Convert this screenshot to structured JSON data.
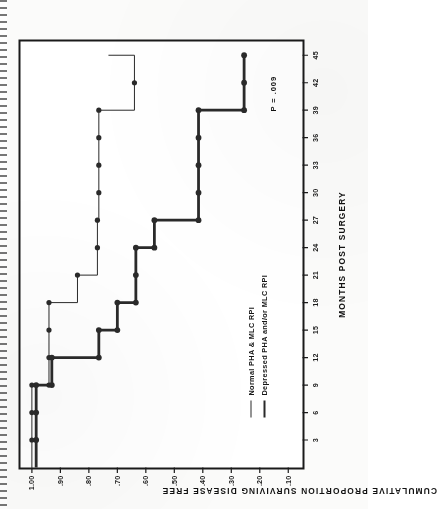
{
  "figure": {
    "p_value_annotation": "P = .009",
    "xlabel": "MONTHS POST SURGERY",
    "ylabel": "CUMULATIVE PROPORTION SURVIVING DISEASE FREE"
  },
  "legend": {
    "items": [
      {
        "label": "Normal PHA & MLC RPI",
        "style": "thin"
      },
      {
        "label": "Depressed PHA and/or MLC RPI",
        "style": "thick"
      }
    ]
  },
  "axis": {
    "x_ticks": [
      "3",
      "6",
      "9",
      "12",
      "15",
      "18",
      "21",
      "24",
      "27",
      "30",
      "33",
      "36",
      "39",
      "42",
      "45"
    ],
    "y_ticks": [
      "1.00",
      ".90",
      ".80",
      ".70",
      ".60",
      ".50",
      ".40",
      ".30",
      ".20",
      ".10"
    ]
  },
  "chart_data": {
    "type": "line",
    "subtype": "kaplan-meier-step",
    "title": "",
    "xlabel": "MONTHS POST SURGERY",
    "ylabel": "CUMULATIVE PROPORTION SURVIVING DISEASE FREE",
    "xlim": [
      0,
      46.5
    ],
    "ylim": [
      0.05,
      1.04
    ],
    "xticks": [
      3,
      6,
      9,
      12,
      15,
      18,
      21,
      24,
      27,
      30,
      33,
      36,
      39,
      42,
      45
    ],
    "yticks": [
      1.0,
      0.9,
      0.8,
      0.7,
      0.6,
      0.5,
      0.4,
      0.3,
      0.2,
      0.1
    ],
    "ytick_labels": [
      "1.00",
      ".90",
      ".80",
      ".70",
      ".60",
      ".50",
      ".40",
      ".30",
      ".20",
      ".10"
    ],
    "grid": false,
    "legend_position": "lower-left-inside",
    "annotations": [
      {
        "text": "P = .009",
        "x": 43.5,
        "y": 0.12
      }
    ],
    "series": [
      {
        "name": "Normal PHA & MLC RPI",
        "style": "thin",
        "color": "#2a2a2a",
        "linewidth": 1.0,
        "marker": "filled-circle",
        "points": [
          {
            "x": 0,
            "y": 1.0,
            "marker": false
          },
          {
            "x": 3,
            "y": 1.0,
            "marker": true
          },
          {
            "x": 6,
            "y": 1.0,
            "marker": true
          },
          {
            "x": 9,
            "y": 1.0,
            "marker": true
          },
          {
            "x": 9,
            "y": 0.94,
            "marker": true
          },
          {
            "x": 12,
            "y": 0.94,
            "marker": true
          },
          {
            "x": 12,
            "y": 0.88,
            "marker": false
          },
          {
            "x": 15,
            "y": 0.94,
            "marker": true
          },
          {
            "x": 18,
            "y": 0.94,
            "marker": true
          },
          {
            "x": 18,
            "y": 0.84,
            "marker": false
          },
          {
            "x": 21,
            "y": 0.84,
            "marker": true
          },
          {
            "x": 21,
            "y": 0.77,
            "marker": false
          },
          {
            "x": 24,
            "y": 0.77,
            "marker": true
          },
          {
            "x": 27,
            "y": 0.77,
            "marker": true
          },
          {
            "x": 27,
            "y": 0.765,
            "marker": false
          },
          {
            "x": 30,
            "y": 0.765,
            "marker": true
          },
          {
            "x": 33,
            "y": 0.765,
            "marker": true
          },
          {
            "x": 36,
            "y": 0.765,
            "marker": true
          },
          {
            "x": 39,
            "y": 0.765,
            "marker": true
          },
          {
            "x": 42,
            "y": 0.64,
            "marker": true
          },
          {
            "x": 45,
            "y": 0.64,
            "marker": false
          }
        ],
        "step_path": [
          [
            0,
            1.0
          ],
          [
            9,
            1.0
          ],
          [
            9,
            0.94
          ],
          [
            15,
            0.94
          ],
          [
            15,
            0.94
          ],
          [
            18,
            0.94
          ],
          [
            18,
            0.84
          ],
          [
            21,
            0.84
          ],
          [
            21,
            0.77
          ],
          [
            27,
            0.77
          ],
          [
            27,
            0.765
          ],
          [
            39,
            0.765
          ],
          [
            39,
            0.64
          ],
          [
            42,
            0.64
          ],
          [
            45,
            0.64
          ]
        ]
      },
      {
        "name": "Depressed PHA and/or MLC RPI",
        "style": "thick",
        "color": "#2a2a2a",
        "linewidth": 2.8,
        "marker": "filled-circle",
        "points": [
          {
            "x": 0,
            "y": 0.985,
            "marker": false
          },
          {
            "x": 3,
            "y": 0.985,
            "marker": true
          },
          {
            "x": 6,
            "y": 0.985,
            "marker": true
          },
          {
            "x": 9,
            "y": 0.985,
            "marker": true
          },
          {
            "x": 9,
            "y": 0.93,
            "marker": true
          },
          {
            "x": 12,
            "y": 0.93,
            "marker": true
          },
          {
            "x": 12,
            "y": 0.765,
            "marker": true
          },
          {
            "x": 15,
            "y": 0.765,
            "marker": true
          },
          {
            "x": 15,
            "y": 0.7,
            "marker": true
          },
          {
            "x": 18,
            "y": 0.7,
            "marker": true
          },
          {
            "x": 18,
            "y": 0.635,
            "marker": true
          },
          {
            "x": 21,
            "y": 0.635,
            "marker": true
          },
          {
            "x": 24,
            "y": 0.635,
            "marker": true
          },
          {
            "x": 24,
            "y": 0.57,
            "marker": true
          },
          {
            "x": 27,
            "y": 0.57,
            "marker": true
          },
          {
            "x": 27,
            "y": 0.415,
            "marker": true
          },
          {
            "x": 30,
            "y": 0.415,
            "marker": true
          },
          {
            "x": 33,
            "y": 0.415,
            "marker": true
          },
          {
            "x": 36,
            "y": 0.415,
            "marker": true
          },
          {
            "x": 39,
            "y": 0.415,
            "marker": true
          },
          {
            "x": 39,
            "y": 0.255,
            "marker": true
          },
          {
            "x": 42,
            "y": 0.255,
            "marker": true
          },
          {
            "x": 45,
            "y": 0.255,
            "marker": true
          }
        ],
        "step_path": [
          [
            0,
            0.985
          ],
          [
            9,
            0.985
          ],
          [
            9,
            0.93
          ],
          [
            12,
            0.93
          ],
          [
            12,
            0.765
          ],
          [
            15,
            0.765
          ],
          [
            15,
            0.7
          ],
          [
            18,
            0.7
          ],
          [
            18,
            0.635
          ],
          [
            24,
            0.635
          ],
          [
            24,
            0.57
          ],
          [
            27,
            0.57
          ],
          [
            27,
            0.415
          ],
          [
            39,
            0.415
          ],
          [
            39,
            0.255
          ],
          [
            45,
            0.255
          ]
        ]
      }
    ]
  }
}
